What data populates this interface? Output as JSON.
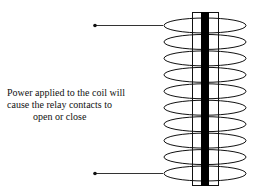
{
  "diagram": {
    "caption_lines": [
      "Power applied to the coil will",
      "cause the relay contacts to",
      "open or close"
    ],
    "coil_turns": 10,
    "leads": [
      "top-lead",
      "bottom-lead"
    ],
    "colors": {
      "line": "#111111",
      "core": "#000000",
      "background": "#ffffff"
    }
  }
}
